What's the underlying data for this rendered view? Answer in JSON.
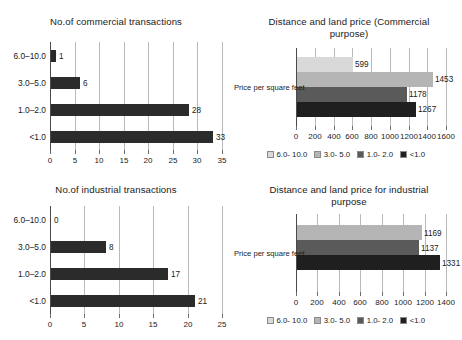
{
  "chart_data": [
    {
      "id": "commercial-transactions",
      "type": "bar",
      "orientation": "horizontal",
      "title": "No.of commercial transactions",
      "xlabel": "",
      "ylabel": "",
      "categories": [
        "6.0–10.0",
        "3.0–5.0",
        "1.0–2.0",
        "<1.0"
      ],
      "values": [
        1,
        6,
        28,
        33
      ],
      "value_labels": [
        "1",
        "6",
        "28",
        "33"
      ],
      "xlim": [
        0,
        35
      ],
      "xticks": [
        0,
        5,
        10,
        15,
        20,
        25,
        30,
        35
      ],
      "xtick_labels": [
        "0",
        "5",
        "10",
        "15",
        "20",
        "25",
        "30",
        "35"
      ],
      "grid": true,
      "bar_color": "#2b2b2b",
      "legend": false
    },
    {
      "id": "commercial-land-price",
      "type": "bar",
      "orientation": "horizontal",
      "title": "Distance and land price (Commercial purpose)",
      "xlabel": "",
      "ylabel": "",
      "categories": [
        "Price per square feet"
      ],
      "series": [
        {
          "name": "6.0- 10.0",
          "values": [
            599
          ],
          "value_labels": [
            "599"
          ],
          "color": "#d9d9d9"
        },
        {
          "name": "3.0- 5.0",
          "values": [
            1453
          ],
          "value_labels": [
            "1453"
          ],
          "color": "#b5b5b5"
        },
        {
          "name": "1.0- 2.0",
          "values": [
            1178
          ],
          "value_labels": [
            "1178"
          ],
          "color": "#5a5a5a"
        },
        {
          "name": "<1.0",
          "values": [
            1267
          ],
          "value_labels": [
            "1267"
          ],
          "color": "#1f1f1f"
        }
      ],
      "xlim": [
        0,
        1600
      ],
      "xticks": [
        0,
        200,
        400,
        600,
        800,
        1000,
        1200,
        1400,
        1600
      ],
      "xtick_labels": [
        "0",
        "200",
        "400",
        "600",
        "800",
        "1000",
        "1200",
        "1400",
        "1600"
      ],
      "grid": true,
      "legend": true,
      "legend_position": "bottom"
    },
    {
      "id": "industrial-transactions",
      "type": "bar",
      "orientation": "horizontal",
      "title": "No.of industrial transactions",
      "xlabel": "",
      "ylabel": "",
      "categories": [
        "6.0–10.0",
        "3.0–5.0",
        "1.0–2.0",
        "<1.0"
      ],
      "values": [
        0,
        8,
        17,
        21
      ],
      "value_labels": [
        "0",
        "8",
        "17",
        "21"
      ],
      "xlim": [
        0,
        25
      ],
      "xticks": [
        0,
        5,
        10,
        15,
        20,
        25
      ],
      "xtick_labels": [
        "0",
        "5",
        "10",
        "15",
        "20",
        "25"
      ],
      "grid": true,
      "bar_color": "#2b2b2b",
      "legend": false
    },
    {
      "id": "industrial-land-price",
      "type": "bar",
      "orientation": "horizontal",
      "title": "Distance and land price for industrial purpose",
      "xlabel": "",
      "ylabel": "",
      "categories": [
        "Price per square feet"
      ],
      "series": [
        {
          "name": "6.0- 10.0",
          "values": [
            0
          ],
          "value_labels": [
            ""
          ],
          "color": "#d9d9d9"
        },
        {
          "name": "3.0- 5.0",
          "values": [
            1169
          ],
          "value_labels": [
            "1169"
          ],
          "color": "#b5b5b5"
        },
        {
          "name": "1.0- 2.0",
          "values": [
            1137
          ],
          "value_labels": [
            "1137"
          ],
          "color": "#5a5a5a"
        },
        {
          "name": "<1.0",
          "values": [
            1331
          ],
          "value_labels": [
            "1331"
          ],
          "color": "#1f1f1f"
        }
      ],
      "xlim": [
        0,
        1400
      ],
      "xticks": [
        0,
        200,
        400,
        600,
        800,
        1000,
        1200,
        1400
      ],
      "xtick_labels": [
        "0",
        "200",
        "400",
        "600",
        "800",
        "1000",
        "1200",
        "1400"
      ],
      "grid": true,
      "legend": true,
      "legend_position": "bottom"
    }
  ],
  "panels": {
    "top_left": {
      "title": "No.of commercial transactions"
    },
    "top_right": {
      "title_line1": "Distance and land price (Commercial",
      "title_line2": "purpose)"
    },
    "bottom_left": {
      "title": "No.of industrial transactions"
    },
    "bottom_right": {
      "title_line1": "Distance and land price for industrial",
      "title_line2": "purpose"
    }
  }
}
